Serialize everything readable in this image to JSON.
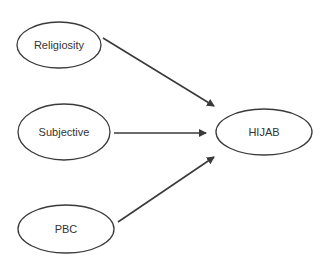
{
  "diagram": {
    "type": "path-model",
    "nodes": [
      {
        "id": "religiosity",
        "label": "Religiosity",
        "cx": 59,
        "cy": 45,
        "rx": 42,
        "ry": 23
      },
      {
        "id": "subjective",
        "label": "Subjective",
        "cx": 64,
        "cy": 132,
        "rx": 46,
        "ry": 28
      },
      {
        "id": "pbc",
        "label": "PBC",
        "cx": 66,
        "cy": 229,
        "rx": 48,
        "ry": 24
      },
      {
        "id": "hijab",
        "label": "HIJAB",
        "cx": 264,
        "cy": 132,
        "rx": 48,
        "ry": 23
      }
    ],
    "edges": [
      {
        "from": "religiosity",
        "to": "hijab"
      },
      {
        "from": "subjective",
        "to": "hijab"
      },
      {
        "from": "pbc",
        "to": "hijab"
      }
    ],
    "colors": {
      "stroke": "#3a3a3a",
      "text": "#333333",
      "background": "#ffffff"
    }
  }
}
